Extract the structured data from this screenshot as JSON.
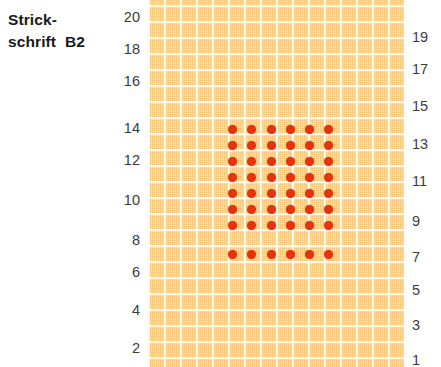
{
  "title": {
    "line1": "Strick-",
    "line2": "schrift  B2"
  },
  "colors": {
    "grid_background": "#f2c679",
    "grid_lines": "#ffffff",
    "dot": "#e8320c",
    "label_text": "#3b3b3b",
    "title_text": "#1a1a1a",
    "page_background": "#ffffff"
  },
  "chart_data": {
    "type": "heatmap",
    "xlabel": "",
    "ylabel": "",
    "grid": {
      "columns": 16,
      "rows": 23,
      "cell_size_px": 16,
      "origin_x_px": 148,
      "origin_y_px": 5
    },
    "left_axis": {
      "label_side": "left",
      "ticks": [
        20,
        18,
        16,
        14,
        12,
        10,
        8,
        6,
        4,
        2
      ],
      "tick_y_px": [
        17,
        49,
        81,
        128,
        160,
        200,
        240,
        272,
        310,
        348
      ]
    },
    "right_axis": {
      "label_side": "right",
      "ticks": [
        19,
        17,
        15,
        13,
        11,
        9,
        7,
        5,
        3,
        1
      ],
      "tick_y_px": [
        37,
        69,
        106,
        144,
        181,
        221,
        257,
        290,
        325,
        360
      ]
    },
    "marks": {
      "symbol": "dot",
      "meaning": "marked stitch",
      "block_columns": 6,
      "block_rows": 8,
      "first_dot_x_px": 232,
      "first_dot_y_px": 129,
      "col_step_px": 19.4,
      "row_step_px": 16.1,
      "points": [
        {
          "col": 1,
          "row": 1,
          "x": 232,
          "y": 129
        },
        {
          "col": 2,
          "row": 1,
          "x": 251,
          "y": 129
        },
        {
          "col": 3,
          "row": 1,
          "x": 271,
          "y": 129
        },
        {
          "col": 4,
          "row": 1,
          "x": 290,
          "y": 129
        },
        {
          "col": 5,
          "row": 1,
          "x": 309,
          "y": 129
        },
        {
          "col": 6,
          "row": 1,
          "x": 328,
          "y": 129
        },
        {
          "col": 1,
          "row": 2,
          "x": 232,
          "y": 145
        },
        {
          "col": 2,
          "row": 2,
          "x": 251,
          "y": 145
        },
        {
          "col": 3,
          "row": 2,
          "x": 271,
          "y": 145
        },
        {
          "col": 4,
          "row": 2,
          "x": 290,
          "y": 145
        },
        {
          "col": 5,
          "row": 2,
          "x": 309,
          "y": 145
        },
        {
          "col": 6,
          "row": 2,
          "x": 328,
          "y": 145
        },
        {
          "col": 1,
          "row": 3,
          "x": 232,
          "y": 161
        },
        {
          "col": 2,
          "row": 3,
          "x": 251,
          "y": 161
        },
        {
          "col": 3,
          "row": 3,
          "x": 271,
          "y": 161
        },
        {
          "col": 4,
          "row": 3,
          "x": 290,
          "y": 161
        },
        {
          "col": 5,
          "row": 3,
          "x": 309,
          "y": 161
        },
        {
          "col": 6,
          "row": 3,
          "x": 328,
          "y": 161
        },
        {
          "col": 1,
          "row": 4,
          "x": 232,
          "y": 177
        },
        {
          "col": 2,
          "row": 4,
          "x": 251,
          "y": 177
        },
        {
          "col": 3,
          "row": 4,
          "x": 271,
          "y": 177
        },
        {
          "col": 4,
          "row": 4,
          "x": 290,
          "y": 177
        },
        {
          "col": 5,
          "row": 4,
          "x": 309,
          "y": 177
        },
        {
          "col": 6,
          "row": 4,
          "x": 328,
          "y": 177
        },
        {
          "col": 1,
          "row": 5,
          "x": 232,
          "y": 193
        },
        {
          "col": 2,
          "row": 5,
          "x": 251,
          "y": 193
        },
        {
          "col": 3,
          "row": 5,
          "x": 271,
          "y": 193
        },
        {
          "col": 4,
          "row": 5,
          "x": 290,
          "y": 193
        },
        {
          "col": 5,
          "row": 5,
          "x": 309,
          "y": 193
        },
        {
          "col": 6,
          "row": 5,
          "x": 328,
          "y": 193
        },
        {
          "col": 1,
          "row": 6,
          "x": 232,
          "y": 209
        },
        {
          "col": 2,
          "row": 6,
          "x": 251,
          "y": 209
        },
        {
          "col": 3,
          "row": 6,
          "x": 271,
          "y": 209
        },
        {
          "col": 4,
          "row": 6,
          "x": 290,
          "y": 209
        },
        {
          "col": 5,
          "row": 6,
          "x": 309,
          "y": 209
        },
        {
          "col": 6,
          "row": 6,
          "x": 328,
          "y": 209
        },
        {
          "col": 1,
          "row": 7,
          "x": 232,
          "y": 225
        },
        {
          "col": 2,
          "row": 7,
          "x": 251,
          "y": 225
        },
        {
          "col": 3,
          "row": 7,
          "x": 271,
          "y": 225
        },
        {
          "col": 4,
          "row": 7,
          "x": 290,
          "y": 225
        },
        {
          "col": 5,
          "row": 7,
          "x": 309,
          "y": 225
        },
        {
          "col": 6,
          "row": 7,
          "x": 328,
          "y": 225
        },
        {
          "col": 1,
          "row": 8,
          "x": 232,
          "y": 254
        },
        {
          "col": 2,
          "row": 8,
          "x": 251,
          "y": 254
        },
        {
          "col": 3,
          "row": 8,
          "x": 271,
          "y": 254
        },
        {
          "col": 4,
          "row": 8,
          "x": 290,
          "y": 254
        },
        {
          "col": 5,
          "row": 8,
          "x": 309,
          "y": 254
        },
        {
          "col": 6,
          "row": 8,
          "x": 328,
          "y": 254
        }
      ]
    }
  }
}
